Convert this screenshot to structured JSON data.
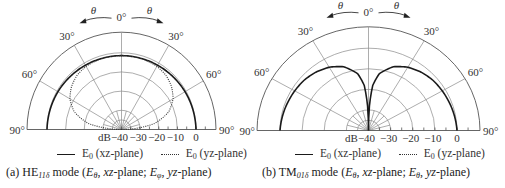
{
  "chart_data": [
    {
      "type": "polar-line",
      "panel": "a",
      "caption": {
        "prefix": "(a) HE",
        "sub": "11δ",
        "rest_1": " mode (",
        "e1": "E",
        "e1_sub": "θ",
        "rest_2": ", ",
        "p1": "xz",
        "rest_3": "-plane; ",
        "e2": "E",
        "e2_sub": "φ",
        "rest_4": ", ",
        "p2": "yz",
        "rest_5": "-plane)"
      },
      "angle_labels": [
        "90°",
        "60°",
        "30°",
        "0°",
        "30°",
        "60°",
        "90°"
      ],
      "theta_label": "θ",
      "radial_axis": {
        "unit": "dB",
        "ticks": [
          "-40",
          "-30",
          "-20",
          "-10",
          "0"
        ],
        "range": [
          -40,
          10
        ]
      },
      "legend": [
        {
          "label": "E",
          "sub": "0",
          "rest": " (xz-plane)",
          "style": "solid"
        },
        {
          "label": "E",
          "sub": "0",
          "rest": " (yz-plane)",
          "style": "dotted"
        }
      ],
      "series": [
        {
          "name": "E0 (xz-plane)",
          "style": "solid",
          "theta_deg": [
            -90,
            -75,
            -60,
            -45,
            -30,
            -15,
            0,
            15,
            30,
            45,
            60,
            75,
            90
          ],
          "db": [
            0,
            -0.3,
            -0.6,
            -1,
            -1.3,
            -1.5,
            -1.5,
            -1.5,
            -1.3,
            -1,
            -0.6,
            -0.3,
            0
          ]
        },
        {
          "name": "E0 (yz-plane)",
          "style": "dotted",
          "theta_deg": [
            -90,
            -80,
            -70,
            -60,
            -50,
            -40,
            -30,
            -15,
            0,
            15,
            30,
            40,
            50,
            60,
            70,
            80,
            90
          ],
          "db": [
            -40,
            -22,
            -13,
            -8,
            -5,
            -3,
            -2,
            -1.5,
            -1.5,
            -1.5,
            -2,
            -3,
            -5,
            -8,
            -13,
            -22,
            -40
          ]
        }
      ]
    },
    {
      "type": "polar-line",
      "panel": "b",
      "caption": {
        "prefix": "(b) TM",
        "sub": "01δ",
        "rest_1": " mode (",
        "e1": "E",
        "e1_sub": "θ",
        "rest_2": ", ",
        "p1": "xz",
        "rest_3": "-plane; ",
        "e2": "E",
        "e2_sub": "θ",
        "rest_4": ", ",
        "p2": "yz",
        "rest_5": "-plane)"
      },
      "angle_labels": [
        "90°",
        "60°",
        "30°",
        "0°",
        "30°",
        "60°",
        "90°"
      ],
      "theta_label": "θ",
      "radial_axis": {
        "unit": "dB",
        "ticks": [
          "-40",
          "-30",
          "-20",
          "-10",
          "0"
        ],
        "range": [
          -40,
          10
        ]
      },
      "legend": [
        {
          "label": "E",
          "sub": "0",
          "rest": " (xz-plane)",
          "style": "solid"
        },
        {
          "label": "E",
          "sub": "0",
          "rest": " (yz-plane)",
          "style": "dotted"
        }
      ],
      "series": [
        {
          "name": "E0 (xz-plane)",
          "style": "solid",
          "theta_deg": [
            -90,
            -80,
            -70,
            -60,
            -50,
            -40,
            -30,
            -20,
            -10,
            -5,
            -2,
            0,
            2,
            5,
            10,
            20,
            30,
            40,
            50,
            60,
            70,
            80,
            90
          ],
          "db": [
            0,
            -0.5,
            -1,
            -1.5,
            -2,
            -3,
            -4.5,
            -7,
            -12,
            -18,
            -28,
            -40,
            -28,
            -18,
            -12,
            -7,
            -4.5,
            -3,
            -2,
            -1.5,
            -1,
            -0.5,
            0
          ]
        }
      ]
    }
  ]
}
